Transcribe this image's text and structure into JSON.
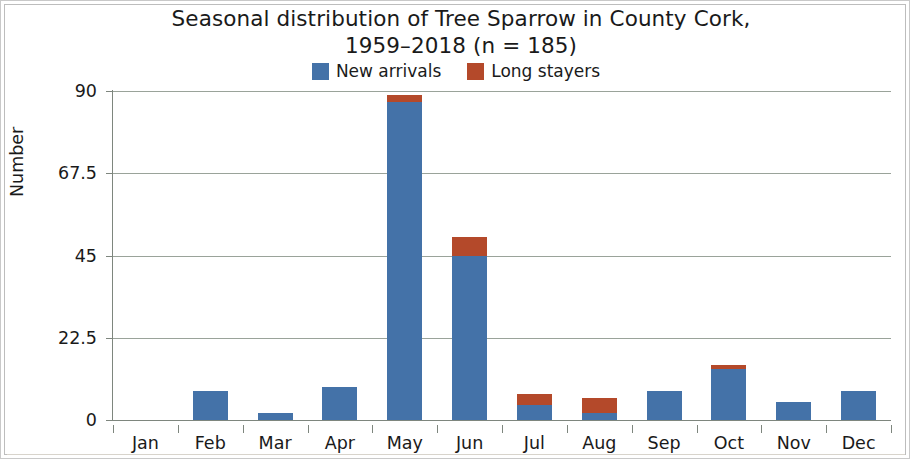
{
  "chart_data": {
    "type": "bar",
    "title_line1": "Seasonal distribution of Tree Sparrow in County Cork,",
    "title_line2": "1959–2018 (n = 185)",
    "xlabel": "",
    "ylabel": "Number",
    "categories": [
      "Jan",
      "Feb",
      "Mar",
      "Apr",
      "May",
      "Jun",
      "Jul",
      "Aug",
      "Sep",
      "Oct",
      "Nov",
      "Dec"
    ],
    "series": [
      {
        "name": "New arrivals",
        "color": "#4472a8",
        "values": [
          0,
          8,
          2,
          9,
          87,
          45,
          4,
          2,
          8,
          14,
          5,
          8
        ]
      },
      {
        "name": "Long stayers",
        "color": "#b4492a",
        "values": [
          0,
          0,
          0,
          0,
          2,
          5,
          3,
          4,
          0,
          1,
          0,
          0
        ]
      }
    ],
    "stacked": true,
    "totals": [
      0,
      8,
      2,
      9,
      89,
      50,
      7,
      6,
      8,
      15,
      5,
      8
    ],
    "ylim": [
      0,
      90
    ],
    "yticks": [
      "0",
      "22.5",
      "45",
      "67.5",
      "90"
    ],
    "ytick_values": [
      0,
      22.5,
      45,
      67.5,
      90
    ],
    "grid": true,
    "legend_position": "top-center"
  },
  "legend": {
    "items": [
      {
        "label": "New arrivals",
        "color": "#4472a8"
      },
      {
        "label": "Long stayers",
        "color": "#b4492a"
      }
    ]
  },
  "axes": {
    "y_title": "Number",
    "y_ticks": [
      "90",
      "67.5",
      "45",
      "22.5",
      "0"
    ],
    "x_ticks": [
      "Jan",
      "Feb",
      "Mar",
      "Apr",
      "May",
      "Jun",
      "Jul",
      "Aug",
      "Sep",
      "Oct",
      "Nov",
      "Dec"
    ]
  }
}
